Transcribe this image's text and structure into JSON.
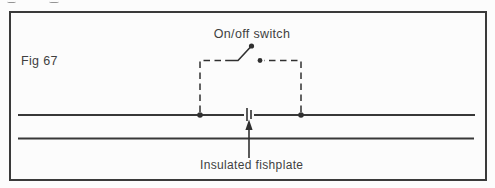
{
  "figure": {
    "number": "Fig 67"
  },
  "labels": {
    "switch": "On/off switch",
    "fishplate": "Insulated fishplate"
  },
  "colors": {
    "ink": "#303030",
    "rail": "#383838",
    "frame": "#3a3a3a",
    "text": "#3f3f3f",
    "background": "#fcfcfc",
    "artifact": "#949494"
  },
  "diagram": {
    "type": "schematic",
    "components": [
      "rail-top",
      "rail-bottom",
      "on-off-switch-symbol",
      "dashed-switch-leads",
      "insulated-fishplate-gap",
      "pointer-arrow"
    ]
  }
}
